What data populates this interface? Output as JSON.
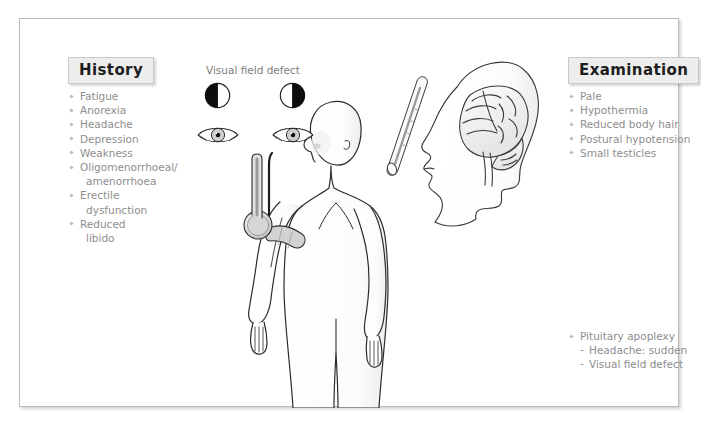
{
  "figure": {
    "title_left": "History",
    "title_right": "Examination",
    "center_caption": "Visual field defect"
  },
  "history": {
    "heading": "History",
    "items": [
      {
        "text": "Fatigue",
        "bullet": true
      },
      {
        "text": "Anorexia",
        "bullet": true
      },
      {
        "text": "Headache",
        "bullet": true
      },
      {
        "text": "Depression",
        "bullet": true
      },
      {
        "text": "Weakness",
        "bullet": true
      },
      {
        "text": "Oligomenorrhoeal/",
        "bullet": true
      },
      {
        "text": "amenorrhoea",
        "bullet": false
      },
      {
        "text": "Erectile",
        "bullet": true
      },
      {
        "text": "dysfunction",
        "bullet": false
      },
      {
        "text": "Reduced",
        "bullet": true
      },
      {
        "text": "libido",
        "bullet": false
      }
    ]
  },
  "examination": {
    "heading": "Examination",
    "items": [
      {
        "text": "Pale",
        "bullet": true
      },
      {
        "text": "Hypothermia",
        "bullet": true
      },
      {
        "text": "Reduced body hair",
        "bullet": true
      },
      {
        "text": "Postural hypotension",
        "bullet": true
      },
      {
        "text": "Small testicles",
        "bullet": true
      }
    ]
  },
  "apoplexy": {
    "items": [
      {
        "text": "Pituitary apoplexy",
        "level": "main"
      },
      {
        "text": "Headache: sudden",
        "level": "sub"
      },
      {
        "text": "Visual field defect",
        "level": "sub"
      }
    ]
  },
  "illustrations": {
    "visual_field_left": "left-half-dark",
    "visual_field_right": "right-half-dark",
    "eye_left": "eye-icon",
    "eye_right": "eye-icon",
    "thermometer": "thermometer-icon",
    "head_brain": "head-brain-icon",
    "body": "human-body-back-view-icon",
    "bp_cuff": "blood-pressure-cuff-icon"
  },
  "colors": {
    "heading_bg": "#ededed",
    "heading_text": "#1d1d1d",
    "list_text": "#8e8e8e",
    "bullet": "#bdbdbd",
    "frame_border": "#b9b9b9",
    "ink": "#2b2b2b",
    "shade": "#f2f2f2"
  }
}
